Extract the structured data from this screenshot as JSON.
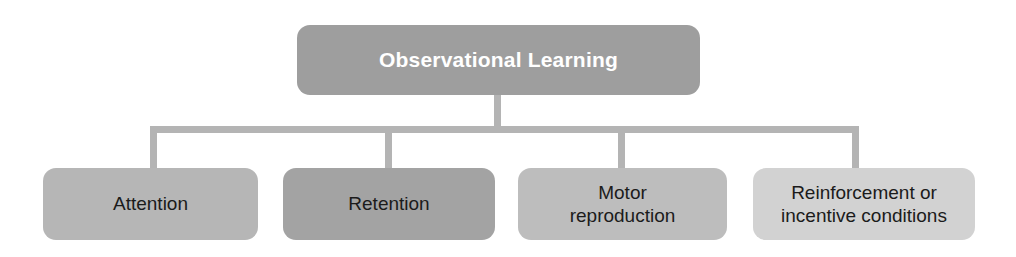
{
  "diagram": {
    "title": "Observational Learning",
    "type": "hierarchy-flowchart",
    "background_color": "#ffffff",
    "connector_color": "#b4b4b4",
    "root": {
      "label": "Observational Learning",
      "fill_color": "#9e9e9e",
      "text_color": "#ffffff"
    },
    "children": [
      {
        "label": "Attention",
        "fill_color": "#b6b6b6",
        "text_color": "#1b1b1b"
      },
      {
        "label": "Retention",
        "fill_color": "#a3a3a3",
        "text_color": "#1b1b1b"
      },
      {
        "label": "Motor\nreproduction",
        "fill_color": "#bdbdbd",
        "text_color": "#1b1b1b"
      },
      {
        "label": "Reinforcement or\nincentive conditions",
        "fill_color": "#d2d2d2",
        "text_color": "#1b1b1b"
      }
    ]
  }
}
